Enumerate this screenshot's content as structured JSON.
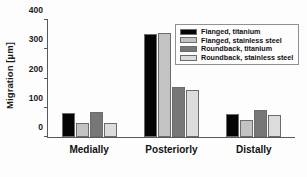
{
  "chart_data": {
    "type": "bar",
    "title": "",
    "xlabel": "",
    "ylabel": "Migration [µm]",
    "categories": [
      "Medially",
      "Posteriorly",
      "Distally"
    ],
    "series": [
      {
        "name": "Flanged, titanium",
        "color": "#050505",
        "values": [
          83,
          348,
          79
        ]
      },
      {
        "name": "Flanged, stainless steel",
        "color": "#c3c3c3",
        "values": [
          47,
          353,
          59
        ]
      },
      {
        "name": "Roundback, titanium",
        "color": "#777777",
        "values": [
          84,
          168,
          92
        ]
      },
      {
        "name": "Roundback, stainless steel",
        "color": "#dcdcdc",
        "values": [
          46,
          160,
          74
        ]
      }
    ],
    "ylim": [
      0,
      400
    ],
    "yticks": [
      0,
      100,
      200,
      300,
      400
    ],
    "ytick_labels": [
      "0",
      "100",
      "200",
      "300",
      "400"
    ],
    "grid": false,
    "legend_position": "upper right"
  },
  "legend": {
    "items": [
      {
        "label": "Flanged, titanium",
        "color": "#050505"
      },
      {
        "label": "Flanged, stainless steel",
        "color": "#c3c3c3"
      },
      {
        "label": "Roundback, titanium",
        "color": "#777777"
      },
      {
        "label": "Roundback, stainless steel",
        "color": "#dcdcdc"
      }
    ]
  }
}
